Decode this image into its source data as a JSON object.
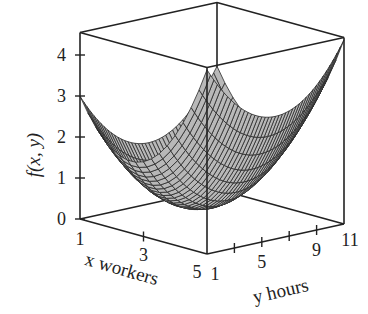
{
  "chart_data": {
    "type": "surface",
    "title": "",
    "xlabel": "x workers",
    "ylabel": "y hours",
    "zlabel": "f(x, y)",
    "x_ticks": [
      1,
      3,
      5
    ],
    "y_ticks": [
      1,
      3,
      5,
      7,
      9,
      11
    ],
    "y_tick_labels": [
      "1",
      "",
      "5",
      "",
      "9",
      "11"
    ],
    "z_ticks": [
      0,
      1,
      2,
      3,
      4
    ],
    "xlim": [
      1,
      5
    ],
    "ylim": [
      1,
      11
    ],
    "zlim": [
      0,
      4.55
    ],
    "surface_model": {
      "form": "c + a*(x-x0)^2 + b*(y-y0)^2",
      "a": 0.48,
      "x0": 2.61,
      "b": 0.06,
      "y0": 6,
      "c": 0.25
    },
    "corner_values": {
      "f(1,1)": 3.0,
      "f(5,1)": 4.5,
      "f(5,11)": 4.5,
      "f(1,11)": 3.0,
      "min": 0.25
    },
    "mesh": {
      "nx": 16,
      "ny": 40
    },
    "colors": {
      "surface": "#b8b8b8",
      "mesh": "#2a2a2a",
      "box": "#222222"
    }
  },
  "projection": {
    "origin": [
      80,
      219
    ],
    "x_step": [
      31.75,
      8.75
    ],
    "y_step": [
      13.7,
      -3.0
    ],
    "z_step": -41
  }
}
